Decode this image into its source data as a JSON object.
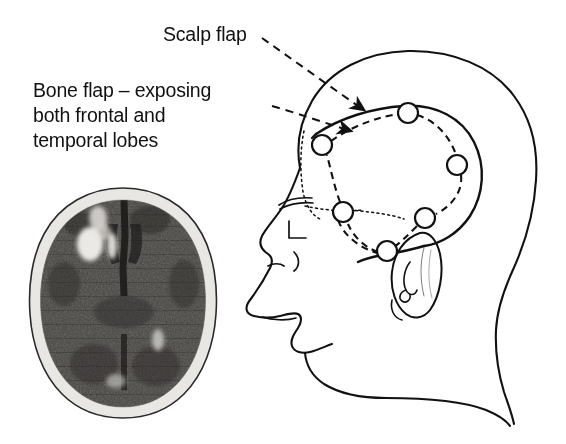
{
  "figure": {
    "background_color": "#ffffff",
    "ink_color": "#111111",
    "width": 566,
    "height": 444
  },
  "labels": {
    "scalp_flap": "Scalp flap",
    "bone_flap_line1": "Bone flap – exposing",
    "bone_flap_line2": "both frontal and",
    "bone_flap_line3": "temporal lobes"
  },
  "diagram": {
    "view": "lateral head profile, facing left",
    "scalp_flap_style": "solid line",
    "bone_flap_style": "dashed line",
    "hairline_style": "dotted line",
    "burr_hole_count": 6,
    "burr_holes": [
      {
        "name": "frontal-anterior",
        "cx": 322,
        "cy": 145,
        "r": 10
      },
      {
        "name": "vertex",
        "cx": 408,
        "cy": 113,
        "r": 10
      },
      {
        "name": "parietal-posterior",
        "cx": 457,
        "cy": 165,
        "r": 10
      },
      {
        "name": "temporal-posterior",
        "cx": 425,
        "cy": 218,
        "r": 10
      },
      {
        "name": "frontal-inferior",
        "cx": 343,
        "cy": 212,
        "r": 10
      },
      {
        "name": "temporal-anterior",
        "cx": 387,
        "cy": 251,
        "r": 10
      }
    ],
    "leader_lines": [
      {
        "name": "scalp-flap-leader",
        "from": [
          262,
          38
        ],
        "to": [
          370,
          113
        ],
        "arrowhead": true
      },
      {
        "name": "bone-flap-leader",
        "from": [
          272,
          106
        ],
        "to": [
          357,
          133
        ],
        "arrowhead": true
      }
    ]
  },
  "ct_scan": {
    "name": "axial-ct-brain",
    "modality": "CT",
    "plane": "axial",
    "skull_color": "#e8e6e2",
    "brain_color": "#4a4845",
    "lesion_color": "#f2f0ec",
    "findings": "hyperdense haemorrhagic lesion in right frontal region, midline falx visible",
    "lesions": [
      {
        "name": "right-frontal-haemorrhage-large",
        "cx": 66,
        "cy": 60,
        "rx": 13,
        "ry": 17
      },
      {
        "name": "right-frontal-haemorrhage-upper",
        "cx": 74,
        "cy": 35,
        "rx": 9,
        "ry": 12
      },
      {
        "name": "right-frontal-haemorrhage-mid",
        "cx": 88,
        "cy": 62,
        "rx": 6,
        "ry": 13
      },
      {
        "name": "posterior-hyperdensity",
        "cx": 134,
        "cy": 156,
        "rx": 6,
        "ry": 11
      },
      {
        "name": "occipital-hyperdensity",
        "cx": 92,
        "cy": 196,
        "rx": 9,
        "ry": 7
      }
    ]
  }
}
